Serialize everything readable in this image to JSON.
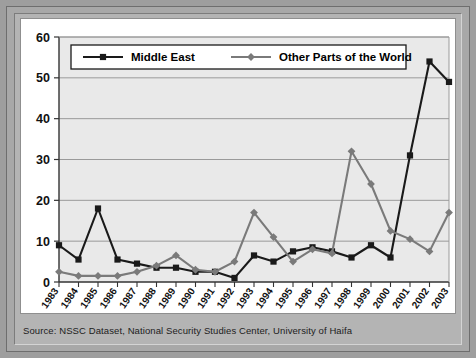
{
  "source": {
    "text": "Source: NSSC Dataset, National Security Studies Center, University of Haifa"
  },
  "colors": {
    "series_middle_east": "#1a1a1a",
    "series_other_world": "#7a7a7a",
    "plot_background": "#e9e9e9",
    "gridline": "#9a9a9a",
    "frame": "#a8a8a8",
    "card_background": "#ffffff"
  },
  "chart_data": {
    "type": "line",
    "title": "",
    "subtitle": "",
    "xlabel": "",
    "ylabel": "",
    "grid": true,
    "legend_position": "top-inside",
    "ylim": [
      0,
      60
    ],
    "yticks": [
      0,
      10,
      20,
      30,
      40,
      50,
      60
    ],
    "categories": [
      "1983",
      "1984",
      "1985",
      "1986",
      "1987",
      "1988",
      "1989",
      "1990",
      "1991",
      "1992",
      "1993",
      "1994",
      "1995",
      "1996",
      "1997",
      "1998",
      "1999",
      "2000",
      "2001",
      "2002",
      "2003"
    ],
    "series": [
      {
        "name": "Middle East",
        "marker": "square",
        "color": "#1a1a1a",
        "values": [
          9,
          5.5,
          18,
          5.5,
          4.5,
          3.5,
          3.5,
          2.5,
          2.5,
          1,
          6.5,
          5,
          7.5,
          8.5,
          7.5,
          6,
          9,
          6,
          31,
          54,
          49
        ]
      },
      {
        "name": "Other Parts of the World",
        "marker": "diamond",
        "color": "#7a7a7a",
        "values": [
          2.5,
          1.5,
          1.5,
          1.5,
          2.5,
          4,
          6.5,
          3,
          2.5,
          5,
          17,
          11,
          5,
          8,
          7,
          32,
          24,
          12.5,
          10.5,
          7.5,
          17
        ]
      }
    ]
  },
  "legend": {
    "items": [
      {
        "label": "Middle East"
      },
      {
        "label": "Other Parts of the World"
      }
    ]
  }
}
